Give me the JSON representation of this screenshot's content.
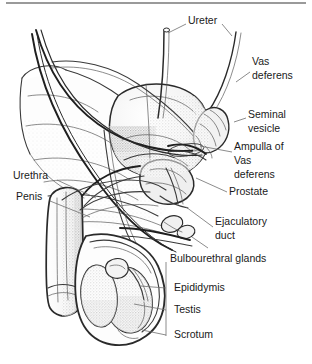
{
  "figure": {
    "style": "pencil line drawing with stippled shading",
    "background_color": "#ffffff",
    "ink_color": "#2a2a2a",
    "leader_color": "#6e6e6e",
    "top_rule_color": "#9a9a9a"
  },
  "labels": [
    {
      "id": "ureter",
      "text": "Ureter",
      "x": 188,
      "y": 21,
      "anchor": "start"
    },
    {
      "id": "vas-deferens",
      "text": "Vas",
      "x": 252,
      "y": 62,
      "anchor": "start"
    },
    {
      "id": "vas-deferens-2",
      "text": "deferens",
      "x": 252,
      "y": 76,
      "anchor": "start"
    },
    {
      "id": "seminal-vesicle",
      "text": "Seminal",
      "x": 248,
      "y": 115,
      "anchor": "start"
    },
    {
      "id": "seminal-vesicle-2",
      "text": "vesicle",
      "x": 248,
      "y": 129,
      "anchor": "start"
    },
    {
      "id": "ampulla",
      "text": "Ampulla of",
      "x": 234,
      "y": 147,
      "anchor": "start"
    },
    {
      "id": "ampulla-2",
      "text": "Vas",
      "x": 234,
      "y": 161,
      "anchor": "start"
    },
    {
      "id": "ampulla-3",
      "text": "deferens",
      "x": 234,
      "y": 175,
      "anchor": "start"
    },
    {
      "id": "prostate",
      "text": "Prostate",
      "x": 229,
      "y": 192,
      "anchor": "start"
    },
    {
      "id": "ejaculatory-duct",
      "text": "Ejaculatory",
      "x": 215,
      "y": 222,
      "anchor": "start"
    },
    {
      "id": "ejaculatory-duct-2",
      "text": "duct",
      "x": 215,
      "y": 236,
      "anchor": "start"
    },
    {
      "id": "bulbourethral-glands",
      "text": "Bulbourethral glands",
      "x": 170,
      "y": 259,
      "anchor": "start"
    },
    {
      "id": "epididymis",
      "text": "Epididymis",
      "x": 174,
      "y": 288,
      "anchor": "start"
    },
    {
      "id": "testis",
      "text": "Testis",
      "x": 174,
      "y": 310,
      "anchor": "start"
    },
    {
      "id": "scrotum",
      "text": "Scrotum",
      "x": 174,
      "y": 335,
      "anchor": "start"
    },
    {
      "id": "urethra",
      "text": "Urethra",
      "x": 13,
      "y": 176,
      "anchor": "start"
    },
    {
      "id": "penis",
      "text": "Penis",
      "x": 16,
      "y": 197,
      "anchor": "start"
    }
  ],
  "leaders": [
    {
      "id": "leader-ureter-left",
      "d": "M 186 24 L 168 33"
    },
    {
      "id": "leader-ureter-right",
      "d": "M 222 24 L 232 36"
    },
    {
      "id": "leader-vas",
      "d": "M 250 72 L 236 82"
    },
    {
      "id": "leader-seminal",
      "d": "M 246 118 L 234 122"
    },
    {
      "id": "leader-ampulla",
      "d": "M 232 152 L 200 146"
    },
    {
      "id": "leader-prostate",
      "d": "M 227 192 L 196 178"
    },
    {
      "id": "leader-ejac",
      "d": "M 213 227 L 186 207"
    },
    {
      "id": "leader-bulbo",
      "d": "M 208 248 L 192 237"
    },
    {
      "id": "bracket-testes",
      "d": "M 166 262 L 166 336"
    },
    {
      "id": "leader-epididymis",
      "d": "M 166 288 L 140 286"
    },
    {
      "id": "leader-testis",
      "d": "M 166 310 L 134 304"
    },
    {
      "id": "leader-scrotum",
      "d": "M 166 335 L 142 330"
    },
    {
      "id": "leader-urethra",
      "d": "M 57 180 L 96 198"
    },
    {
      "id": "leader-penis",
      "d": "M 50 201 L 90 217"
    }
  ]
}
